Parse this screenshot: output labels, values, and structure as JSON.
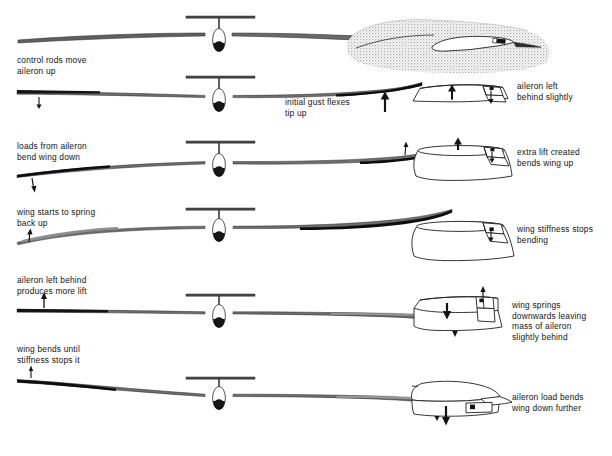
{
  "figure": {
    "background_color": "#ffffff",
    "ink_color": "#141414",
    "stipple_color": "#9a9a9a"
  },
  "stages": [
    {
      "id": "stage-1",
      "index": 1,
      "left_label": "",
      "right_label": "",
      "detail_label": "",
      "detail_kind": "airfoil-section-in-gust",
      "glider": "level wings, slight droop"
    },
    {
      "id": "stage-2",
      "index": 2,
      "left_label": "control rods move\naileron up",
      "right_label": "initial gust flexes\ntip up",
      "detail_label": "aileron left\nbehind slightly",
      "detail_kind": "wing-panel-lift-up-aileron-down",
      "glider": "left aileron up, right tip flexed up"
    },
    {
      "id": "stage-3",
      "index": 3,
      "left_label": "loads from aileron\nbend wing down",
      "right_label": "",
      "detail_label": "extra lift created\nbends wing up",
      "detail_kind": "wing-panel-bent-up",
      "glider": "left wing bent down, right wing bent up"
    },
    {
      "id": "stage-4",
      "index": 4,
      "left_label": "wing starts to spring\nback up",
      "right_label": "",
      "detail_label": "wing stiffness stops\nbending",
      "detail_kind": "wing-panel-stiffness-limit",
      "glider": "left wing springing up, right wing curving over"
    },
    {
      "id": "stage-5",
      "index": 5,
      "left_label": "aileron left behind\nproduces more lift",
      "right_label": "",
      "detail_label": "wing springs\ndownwards leaving\nmass of aileron\nslightly behind",
      "detail_kind": "wing-panel-springing-down",
      "glider": "near level, left tip rising, right tip falling"
    },
    {
      "id": "stage-6",
      "index": 6,
      "left_label": "wing bends until\nstiffness stops it",
      "right_label": "",
      "detail_label": "aileron load bends\nwing down further",
      "detail_kind": "wing-panel-bent-down",
      "glider": "left tip high, right tip low"
    }
  ],
  "arrows": [
    {
      "name": "stage-2-left-down",
      "direction": "down"
    },
    {
      "name": "stage-2-right-up",
      "direction": "up"
    },
    {
      "name": "stage-3-left-down",
      "direction": "down"
    },
    {
      "name": "stage-3-right-up",
      "direction": "up"
    },
    {
      "name": "stage-4-left-up",
      "direction": "up"
    },
    {
      "name": "stage-4-right-down",
      "direction": "down"
    },
    {
      "name": "stage-5-left-up",
      "direction": "up"
    },
    {
      "name": "stage-5-right-down",
      "direction": "down"
    },
    {
      "name": "stage-6-left-up",
      "direction": "up"
    },
    {
      "name": "stage-6-right-down",
      "direction": "down"
    },
    {
      "name": "detail-2-lift-up",
      "direction": "up"
    },
    {
      "name": "detail-2-aileron-down",
      "direction": "down"
    },
    {
      "name": "detail-3-lift-up",
      "direction": "up"
    },
    {
      "name": "detail-3-aileron-down",
      "direction": "down"
    },
    {
      "name": "detail-4-aileron-down",
      "direction": "down"
    },
    {
      "name": "detail-5-aileron-up",
      "direction": "up"
    },
    {
      "name": "detail-5-wing-down",
      "direction": "down"
    },
    {
      "name": "detail-6-wing-down",
      "direction": "down"
    }
  ]
}
